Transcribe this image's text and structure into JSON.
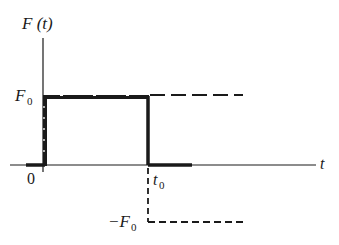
{
  "diagram": {
    "type": "step-function-plot",
    "y_axis_label": "F (t)",
    "x_axis_label": "t",
    "origin_label": "0",
    "labels": {
      "F0": "F",
      "F0_sub": "0",
      "negF0_prefix": "−F",
      "negF0_sub": "0",
      "t0": "t",
      "t0_sub": "0"
    },
    "colors": {
      "ink": "#1a1a1a",
      "background": "#ffffff"
    }
  }
}
